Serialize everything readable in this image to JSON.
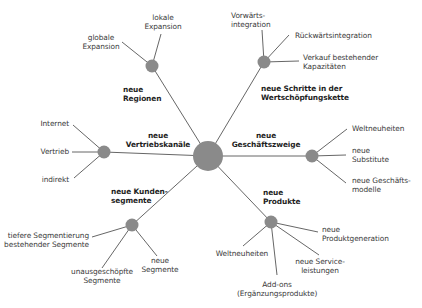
{
  "diagram": {
    "colors": {
      "line": "#555555",
      "node": "#8a8a8a",
      "text": "#3a3a3a",
      "category": "#1e1e1e"
    },
    "center": {
      "x": 208,
      "y": 156,
      "r": 15
    },
    "categories": [
      {
        "id": "regionen",
        "label_line1": "neue",
        "label_line2": "Regionen",
        "hub": {
          "x": 152,
          "y": 66
        },
        "leaves": [
          {
            "label_line1": "globale",
            "label_line2": "Expansion"
          },
          {
            "label_line1": "lokale",
            "label_line2": "Expansion"
          }
        ]
      },
      {
        "id": "wertschoepfung",
        "label_line1": "neue Schritte in der",
        "label_line2": "Wertschöpfungskette",
        "hub": {
          "x": 264,
          "y": 62
        },
        "leaves": [
          {
            "label_line1": "Vorwärts-",
            "label_line2": "integration"
          },
          {
            "label_line1": "Rückwärtsintegration",
            "label_line2": ""
          },
          {
            "label_line1": "Verkauf bestehender",
            "label_line2": "Kapazitäten"
          }
        ]
      },
      {
        "id": "vertriebskanaele",
        "label_line1": "neue",
        "label_line2": "Vertriebskanäle",
        "hub": {
          "x": 104,
          "y": 152
        },
        "leaves": [
          {
            "label_line1": "Internet",
            "label_line2": ""
          },
          {
            "label_line1": "Vertrieb",
            "label_line2": ""
          },
          {
            "label_line1": "indirekt",
            "label_line2": ""
          }
        ]
      },
      {
        "id": "geschaeftszweige",
        "label_line1": "neue",
        "label_line2": "Geschäftszweige",
        "hub": {
          "x": 312,
          "y": 156
        },
        "leaves": [
          {
            "label_line1": "Weltneuheiten",
            "label_line2": ""
          },
          {
            "label_line1": "neue",
            "label_line2": "Substitute"
          },
          {
            "label_line1": "neue Geschäfts-",
            "label_line2": "modelle"
          }
        ]
      },
      {
        "id": "kundensegmente",
        "label_line1": "neue Kunden-",
        "label_line2": "segmente",
        "hub": {
          "x": 132,
          "y": 225
        },
        "leaves": [
          {
            "label_line1": "tiefere Segmentierung",
            "label_line2": "bestehender Segmente"
          },
          {
            "label_line1": "unausgeschöpfte",
            "label_line2": "Segmente"
          },
          {
            "label_line1": "neue",
            "label_line2": "Segmente"
          }
        ]
      },
      {
        "id": "produkte",
        "label_line1": "neue",
        "label_line2": "Produkte",
        "hub": {
          "x": 271,
          "y": 222
        },
        "leaves": [
          {
            "label_line1": "neue",
            "label_line2": "Produktgeneration"
          },
          {
            "label_line1": "neue Service-",
            "label_line2": "leistungen"
          },
          {
            "label_line1": "Add-ons",
            "label_line2": "(Ergänzungsprodukte)"
          },
          {
            "label_line1": "Weltneuheiten",
            "label_line2": ""
          }
        ]
      }
    ]
  }
}
